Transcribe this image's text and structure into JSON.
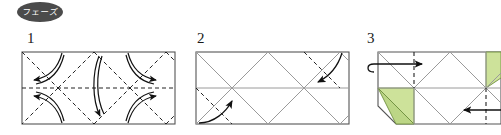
{
  "document": {
    "type": "origami-instruction-diagram",
    "width": 501,
    "height": 135,
    "background_color": "#ffffff"
  },
  "phase_badge": {
    "label": "フェーズ",
    "shape": "oval",
    "fill_color": "#4b4b4b",
    "text_color": "#ffffff"
  },
  "steps": [
    {
      "number": "1",
      "name": "step-1",
      "description": "Flat rectangle with full diagonal and horizontal crease pattern; curved arrows indicate inward collapse",
      "paper_state": "unfolded rectangle",
      "crease_style": "dashed",
      "arrow_count": 5
    },
    {
      "number": "2",
      "name": "step-2",
      "description": "Rectangle with existing gray creases; two dashed diagonal fold lines with curved arrows folding corners inward",
      "paper_state": "creased rectangle",
      "crease_style": "gray solid plus dashed",
      "arrow_count": 2
    },
    {
      "number": "3",
      "name": "step-3",
      "description": "Partially collapsed form with green underside showing; vertical dashed fold lines and straight arrows folding ends toward center",
      "paper_state": "partially collapsed",
      "crease_style": "gray solid plus vertical dashed",
      "arrow_count": 2,
      "highlight_color": "#cde29a"
    }
  ],
  "colors": {
    "paper_front": "#ffffff",
    "paper_back": "#cde29a",
    "paper_back_shade": "#bcd686",
    "outline": "#555555",
    "crease_gray": "#9a9a9a",
    "crease_dashed": "#333333",
    "arrow": "#111111",
    "badge": "#4b4b4b"
  }
}
